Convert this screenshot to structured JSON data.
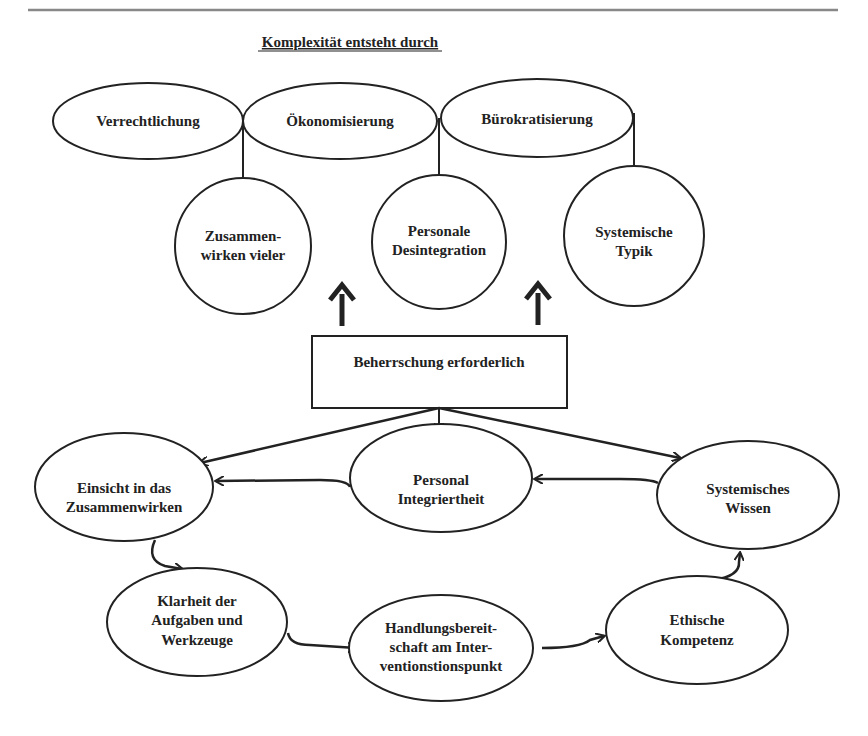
{
  "diagram": {
    "title": "Komplexität entsteht durch",
    "top_ellipses": [
      {
        "label": "Verrechtlichung"
      },
      {
        "label": "Ökonomisierung"
      },
      {
        "label": "Bürokratisierung"
      }
    ],
    "circles": [
      {
        "lines": [
          "Zusammen-",
          "wirken vieler"
        ]
      },
      {
        "lines": [
          "Personale",
          "Desintegration"
        ]
      },
      {
        "lines": [
          "Systemische",
          "Typik"
        ]
      }
    ],
    "center_box": {
      "label": "Beherrschung erforderlich"
    },
    "competencies": [
      {
        "id": "einsicht",
        "lines": [
          "Einsicht in das",
          "Zusammenwirken"
        ]
      },
      {
        "id": "integriertheit",
        "lines": [
          "Personal",
          "Integriertheit"
        ]
      },
      {
        "id": "wissen",
        "lines": [
          "Systemisches",
          "Wissen"
        ]
      },
      {
        "id": "klarheit",
        "lines": [
          "Klarheit der",
          "Aufgaben und",
          "Werkzeuge"
        ]
      },
      {
        "id": "handlung",
        "lines": [
          "Handlungsbereit-",
          "schaft am Inter-",
          "ventionstionspunkt"
        ]
      },
      {
        "id": "ethik",
        "lines": [
          "Ethische",
          "Kompetenz"
        ]
      }
    ],
    "colors": {
      "ink": "#222222",
      "rule": "#888888",
      "background": "#ffffff"
    }
  }
}
